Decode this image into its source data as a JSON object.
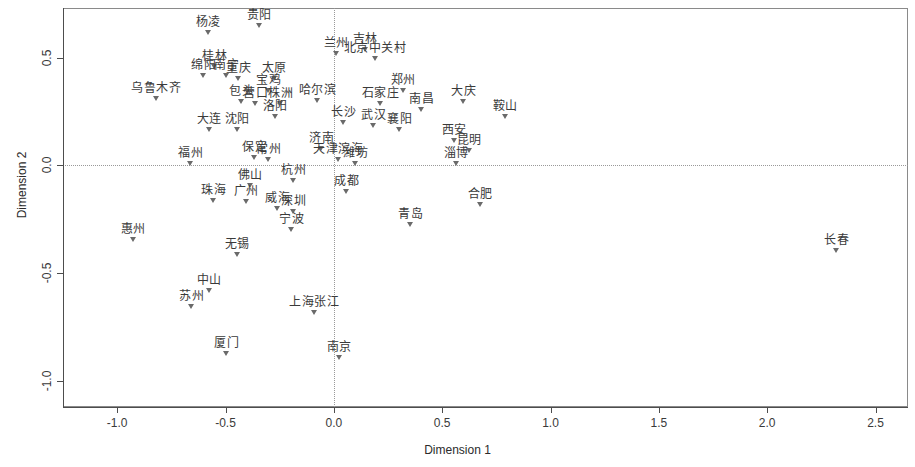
{
  "chart_data": {
    "type": "scatter",
    "title": "",
    "xlabel": "Dimension 1",
    "ylabel": "Dimension 2",
    "xlim": [
      -1.25,
      2.65
    ],
    "ylim": [
      -1.12,
      0.73
    ],
    "xticks": [
      -1.0,
      -0.5,
      0.0,
      0.5,
      1.0,
      1.5,
      2.0,
      2.5
    ],
    "xticklabels": [
      "-1.0",
      "-0.5",
      "0.0",
      "0.5",
      "1.0",
      "1.5",
      "2.0",
      "2.5"
    ],
    "yticks": [
      0.5,
      0.0,
      -0.5,
      -1.0
    ],
    "yticklabels": [
      "0.5",
      "0.0",
      "-0.5",
      "-1.0"
    ],
    "grid": false,
    "reference_lines": {
      "vertical_x": 0.0,
      "horizontal_y": 0.0,
      "style": "dotted"
    },
    "marker": "triangle-down",
    "marker_color": "#6a6a6a",
    "label_color": "#3a3a3a",
    "points": [
      {
        "label": "杨凌",
        "x": -0.58,
        "y": 0.615
      },
      {
        "label": "贵阳",
        "x": -0.345,
        "y": 0.645
      },
      {
        "label": "吉林",
        "x": 0.145,
        "y": 0.535
      },
      {
        "label": "兰州",
        "x": 0.01,
        "y": 0.515
      },
      {
        "label": "北京中关村",
        "x": 0.19,
        "y": 0.495
      },
      {
        "label": "桂林",
        "x": -0.55,
        "y": 0.455
      },
      {
        "label": "绵阳",
        "x": -0.6,
        "y": 0.415
      },
      {
        "label": "南宁",
        "x": -0.495,
        "y": 0.415
      },
      {
        "label": "重庆",
        "x": -0.44,
        "y": 0.4
      },
      {
        "label": "太原",
        "x": -0.275,
        "y": 0.4
      },
      {
        "label": "宝鸡",
        "x": -0.3,
        "y": 0.345
      },
      {
        "label": "郑州",
        "x": 0.32,
        "y": 0.345
      },
      {
        "label": "乌鲁木齐",
        "x": -0.82,
        "y": 0.31
      },
      {
        "label": "包头",
        "x": -0.425,
        "y": 0.295
      },
      {
        "label": "哈尔滨",
        "x": -0.075,
        "y": 0.3
      },
      {
        "label": "营口",
        "x": -0.36,
        "y": 0.285
      },
      {
        "label": "株洲",
        "x": -0.245,
        "y": 0.285
      },
      {
        "label": "石家庄",
        "x": 0.215,
        "y": 0.285
      },
      {
        "label": "大庆",
        "x": 0.6,
        "y": 0.295
      },
      {
        "label": "南昌",
        "x": 0.405,
        "y": 0.255
      },
      {
        "label": "洛阳",
        "x": -0.27,
        "y": 0.225
      },
      {
        "label": "鞍山",
        "x": 0.79,
        "y": 0.225
      },
      {
        "label": "长沙",
        "x": 0.045,
        "y": 0.195
      },
      {
        "label": "武汉",
        "x": 0.185,
        "y": 0.185
      },
      {
        "label": "襄阳",
        "x": 0.305,
        "y": 0.165
      },
      {
        "label": "大连",
        "x": -0.575,
        "y": 0.165
      },
      {
        "label": "沈阳",
        "x": -0.445,
        "y": 0.165
      },
      {
        "label": "西安",
        "x": 0.555,
        "y": 0.115
      },
      {
        "label": "济南",
        "x": -0.055,
        "y": 0.075
      },
      {
        "label": "昆明",
        "x": 0.625,
        "y": 0.065
      },
      {
        "label": "保定",
        "x": -0.365,
        "y": 0.035
      },
      {
        "label": "常州",
        "x": -0.3,
        "y": 0.025
      },
      {
        "label": "天津滨海",
        "x": 0.02,
        "y": 0.025
      },
      {
        "label": "潍坊",
        "x": 0.1,
        "y": 0.005
      },
      {
        "label": "福州",
        "x": -0.66,
        "y": 0.005
      },
      {
        "label": "淄博",
        "x": 0.565,
        "y": 0.005
      },
      {
        "label": "杭州",
        "x": -0.185,
        "y": -0.07
      },
      {
        "label": "佛山",
        "x": -0.385,
        "y": -0.095
      },
      {
        "label": "成都",
        "x": 0.06,
        "y": -0.125
      },
      {
        "label": "珠海",
        "x": -0.555,
        "y": -0.165
      },
      {
        "label": "广州",
        "x": -0.405,
        "y": -0.17
      },
      {
        "label": "威海",
        "x": -0.26,
        "y": -0.2
      },
      {
        "label": "深圳",
        "x": -0.185,
        "y": -0.215
      },
      {
        "label": "合肥",
        "x": 0.675,
        "y": -0.185
      },
      {
        "label": "青岛",
        "x": 0.355,
        "y": -0.275
      },
      {
        "label": "宁波",
        "x": -0.195,
        "y": -0.3
      },
      {
        "label": "惠州",
        "x": -0.925,
        "y": -0.345
      },
      {
        "label": "长春",
        "x": 2.32,
        "y": -0.395
      },
      {
        "label": "无锡",
        "x": -0.445,
        "y": -0.415
      },
      {
        "label": "中山",
        "x": -0.575,
        "y": -0.58
      },
      {
        "label": "苏州",
        "x": -0.655,
        "y": -0.655
      },
      {
        "label": "上海张江",
        "x": -0.09,
        "y": -0.685
      },
      {
        "label": "厦门",
        "x": -0.495,
        "y": -0.875
      },
      {
        "label": "南京",
        "x": 0.025,
        "y": -0.895
      }
    ]
  }
}
